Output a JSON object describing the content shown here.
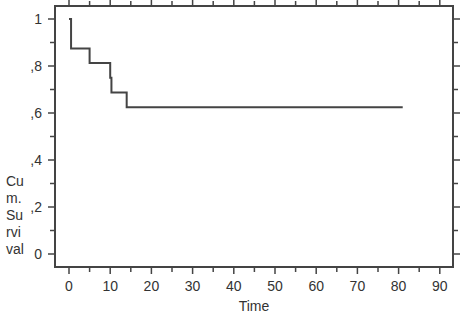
{
  "chart_data": {
    "type": "line",
    "subtype": "kaplan-meier-step",
    "title": "",
    "xlabel": "Time",
    "ylabel": "Cum. Survival",
    "ylabel_wrapped": [
      "Cu",
      "m.",
      "Su",
      "rvi",
      "val"
    ],
    "xlim": [
      -2,
      93
    ],
    "ylim": [
      -0.06,
      1.1
    ],
    "x_ticks": [
      0,
      10,
      20,
      30,
      40,
      50,
      60,
      70,
      80,
      90
    ],
    "x_tick_labels": [
      "0",
      "10",
      "20",
      "30",
      "40",
      "50",
      "60",
      "70",
      "80",
      "90"
    ],
    "y_ticks": [
      0,
      0.2,
      0.4,
      0.6,
      0.8,
      1.0
    ],
    "y_tick_labels": [
      "0",
      ",2",
      ",4",
      ",6",
      ",8",
      "1"
    ],
    "grid": false,
    "legend": null,
    "series": [
      {
        "name": "Survival Function",
        "color": "#444444",
        "steps": [
          {
            "t": 0,
            "s": 1.0
          },
          {
            "t": 0.5,
            "s": 0.875
          },
          {
            "t": 5,
            "s": 0.8125
          },
          {
            "t": 10,
            "s": 0.75
          },
          {
            "t": 10.3,
            "s": 0.6875
          },
          {
            "t": 14,
            "s": 0.625
          }
        ],
        "end_time": 81
      }
    ]
  }
}
